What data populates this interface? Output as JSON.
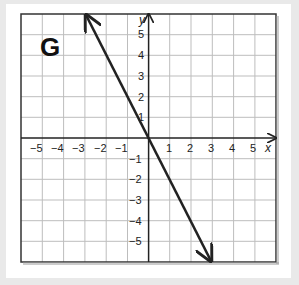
{
  "graph": {
    "label": "G",
    "x_axis_label": "x",
    "y_axis_label": "y",
    "x_ticks": [
      "−5",
      "−4",
      "−3",
      "−2",
      "−1",
      "1",
      "2",
      "3",
      "4",
      "5"
    ],
    "y_ticks": [
      "5",
      "4",
      "3",
      "2",
      "1",
      "−1",
      "−2",
      "−3",
      "−4",
      "−5"
    ],
    "range": {
      "x": [
        -6,
        6
      ],
      "y": [
        -6,
        6
      ]
    }
  },
  "line": {
    "start": [
      -3,
      6
    ],
    "end": [
      3,
      -6
    ],
    "slope": -2,
    "intercept": 0,
    "color": "#222222"
  }
}
